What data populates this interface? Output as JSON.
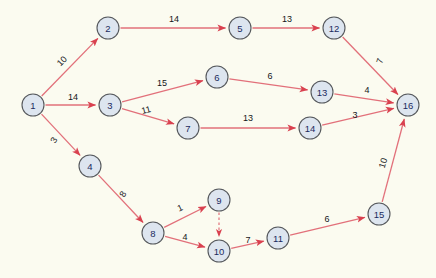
{
  "diagram": {
    "type": "directed-weighted-graph",
    "title": "",
    "background_color": "#fbfbf0",
    "node_fill_color": "#dde5ef",
    "node_stroke_color": "#55585c",
    "node_label_color": "#1b2a5e",
    "edge_color": "#e2707a",
    "edge_label_color": "#15161a",
    "node_radius": 11,
    "nodes": [
      {
        "id": "1",
        "label": "1",
        "x": 33,
        "y": 105
      },
      {
        "id": "2",
        "label": "2",
        "x": 108,
        "y": 28
      },
      {
        "id": "3",
        "label": "3",
        "x": 110,
        "y": 105
      },
      {
        "id": "4",
        "label": "4",
        "x": 90,
        "y": 166
      },
      {
        "id": "5",
        "label": "5",
        "x": 240,
        "y": 28
      },
      {
        "id": "6",
        "label": "6",
        "x": 217,
        "y": 77
      },
      {
        "id": "7",
        "label": "7",
        "x": 188,
        "y": 128
      },
      {
        "id": "8",
        "label": "8",
        "x": 153,
        "y": 233
      },
      {
        "id": "9",
        "label": "9",
        "x": 219,
        "y": 200
      },
      {
        "id": "10",
        "label": "10",
        "x": 219,
        "y": 251
      },
      {
        "id": "11",
        "label": "11",
        "x": 278,
        "y": 238
      },
      {
        "id": "12",
        "label": "12",
        "x": 334,
        "y": 28
      },
      {
        "id": "13",
        "label": "13",
        "x": 322,
        "y": 92
      },
      {
        "id": "14",
        "label": "14",
        "x": 310,
        "y": 128
      },
      {
        "id": "15",
        "label": "15",
        "x": 379,
        "y": 214
      },
      {
        "id": "16",
        "label": "16",
        "x": 408,
        "y": 105
      }
    ],
    "edges": [
      {
        "from": "1",
        "to": "2",
        "weight": "10",
        "style": "solid",
        "label_x": 62,
        "label_y": 61,
        "label_rotate": -45
      },
      {
        "from": "1",
        "to": "3",
        "weight": "14",
        "style": "solid",
        "label_x": 73,
        "label_y": 97,
        "label_rotate": 0
      },
      {
        "from": "1",
        "to": "4",
        "weight": "3",
        "style": "solid",
        "label_x": 54,
        "label_y": 140,
        "label_rotate": -60
      },
      {
        "from": "2",
        "to": "5",
        "weight": "14",
        "style": "solid",
        "label_x": 174,
        "label_y": 19,
        "label_rotate": 0
      },
      {
        "from": "3",
        "to": "6",
        "weight": "15",
        "style": "solid",
        "label_x": 162,
        "label_y": 83,
        "label_rotate": 0
      },
      {
        "from": "3",
        "to": "7",
        "weight": "11",
        "style": "solid",
        "label_x": 146,
        "label_y": 110,
        "label_rotate": -14
      },
      {
        "from": "4",
        "to": "8",
        "weight": "8",
        "style": "solid",
        "label_x": 123,
        "label_y": 194,
        "label_rotate": -60
      },
      {
        "from": "5",
        "to": "12",
        "weight": "13",
        "style": "solid",
        "label_x": 287,
        "label_y": 19,
        "label_rotate": 0
      },
      {
        "from": "6",
        "to": "13",
        "weight": "6",
        "style": "solid",
        "label_x": 270,
        "label_y": 76,
        "label_rotate": 0
      },
      {
        "from": "7",
        "to": "14",
        "weight": "13",
        "style": "solid",
        "label_x": 248,
        "label_y": 118,
        "label_rotate": 0
      },
      {
        "from": "8",
        "to": "9",
        "weight": "1",
        "style": "solid",
        "label_x": 180,
        "label_y": 208,
        "label_rotate": -25
      },
      {
        "from": "8",
        "to": "10",
        "weight": "4",
        "style": "solid",
        "label_x": 185,
        "label_y": 237,
        "label_rotate": 0
      },
      {
        "from": "9",
        "to": "10",
        "weight": "",
        "style": "dashed",
        "label_x": 0,
        "label_y": 0,
        "label_rotate": 0
      },
      {
        "from": "10",
        "to": "11",
        "weight": "7",
        "style": "solid",
        "label_x": 248,
        "label_y": 240,
        "label_rotate": 0
      },
      {
        "from": "11",
        "to": "15",
        "weight": "6",
        "style": "solid",
        "label_x": 327,
        "label_y": 219,
        "label_rotate": 0
      },
      {
        "from": "12",
        "to": "16",
        "weight": "7",
        "style": "solid",
        "label_x": 380,
        "label_y": 61,
        "label_rotate": -72
      },
      {
        "from": "13",
        "to": "16",
        "weight": "4",
        "style": "solid",
        "label_x": 367,
        "label_y": 90,
        "label_rotate": 0
      },
      {
        "from": "14",
        "to": "16",
        "weight": "3",
        "style": "solid",
        "label_x": 355,
        "label_y": 115,
        "label_rotate": 0
      },
      {
        "from": "15",
        "to": "16",
        "weight": "10",
        "style": "solid",
        "label_x": 383,
        "label_y": 163,
        "label_rotate": -74
      }
    ]
  }
}
